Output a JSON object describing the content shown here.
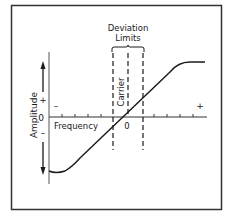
{
  "diagram": {
    "title_label": {
      "line1": "Deviation",
      "line2": "Limits"
    },
    "y_axis": {
      "label": "Amplitude",
      "plus": "+",
      "zero": "0",
      "minus": "–"
    },
    "x_axis": {
      "label": "Frequency",
      "origin": "0",
      "minus": "–",
      "plus": "+"
    },
    "carrier_label": "Carrier",
    "colors": {
      "stroke": "#1a1a1a",
      "frame": "#333333",
      "background": "#ffffff"
    }
  }
}
